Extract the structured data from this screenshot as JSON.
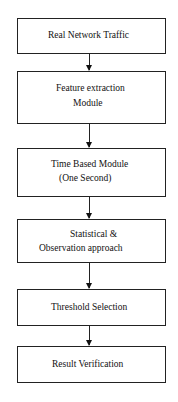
{
  "diagram": {
    "type": "flowchart",
    "direction": "top-to-bottom",
    "nodes": [
      {
        "id": "n1",
        "lines": [
          "Real Network Traffic"
        ]
      },
      {
        "id": "n2",
        "lines": [
          "Feature extraction",
          "Module"
        ]
      },
      {
        "id": "n3",
        "lines": [
          "Time Based Module",
          "(One Second)"
        ]
      },
      {
        "id": "n4",
        "lines": [
          "Statistical &",
          "Observation approach"
        ]
      },
      {
        "id": "n5",
        "lines": [
          "Threshold Selection"
        ]
      },
      {
        "id": "n6",
        "lines": [
          "Result Verification"
        ]
      }
    ],
    "edges": [
      {
        "from": "n1",
        "to": "n2"
      },
      {
        "from": "n2",
        "to": "n3"
      },
      {
        "from": "n3",
        "to": "n4"
      },
      {
        "from": "n4",
        "to": "n5"
      },
      {
        "from": "n5",
        "to": "n6"
      }
    ],
    "colors": {
      "stroke": "#222222",
      "background": "#ffffff",
      "text": "#111111"
    }
  }
}
